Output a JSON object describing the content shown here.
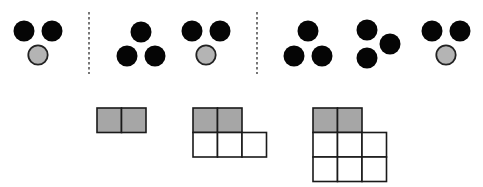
{
  "colors": {
    "background": "#ffffff",
    "black_dot": "#050505",
    "gray_dot_fill": "#b4b4b4",
    "gray_dot_stroke": "#222222",
    "gray_cell_fill": "#a6a6a6",
    "white_cell_fill": "#ffffff",
    "grid_stroke": "#1a1a1a",
    "divider": "#555555"
  },
  "dot_radius": 10.5,
  "dot_groups": [
    {
      "id": "group-1",
      "dots": [
        {
          "cx": 24,
          "cy": 31,
          "kind": "black"
        },
        {
          "cx": 52,
          "cy": 31,
          "kind": "black"
        },
        {
          "cx": 38,
          "cy": 55,
          "kind": "gray"
        }
      ]
    },
    {
      "id": "group-2",
      "dots": [
        {
          "cx": 141,
          "cy": 32,
          "kind": "black"
        },
        {
          "cx": 127,
          "cy": 56,
          "kind": "black"
        },
        {
          "cx": 155,
          "cy": 56,
          "kind": "black"
        }
      ]
    },
    {
      "id": "group-3",
      "dots": [
        {
          "cx": 192,
          "cy": 31,
          "kind": "black"
        },
        {
          "cx": 220,
          "cy": 31,
          "kind": "black"
        },
        {
          "cx": 206,
          "cy": 55,
          "kind": "gray"
        }
      ]
    },
    {
      "id": "group-4",
      "dots": [
        {
          "cx": 308,
          "cy": 31,
          "kind": "black"
        },
        {
          "cx": 294,
          "cy": 56,
          "kind": "black"
        },
        {
          "cx": 322,
          "cy": 56,
          "kind": "black"
        }
      ]
    },
    {
      "id": "group-5",
      "dots": [
        {
          "cx": 367,
          "cy": 30,
          "kind": "black"
        },
        {
          "cx": 390,
          "cy": 44,
          "kind": "black"
        },
        {
          "cx": 367,
          "cy": 58,
          "kind": "black"
        }
      ]
    },
    {
      "id": "group-6",
      "dots": [
        {
          "cx": 432,
          "cy": 31,
          "kind": "black"
        },
        {
          "cx": 460,
          "cy": 31,
          "kind": "black"
        },
        {
          "cx": 446,
          "cy": 55,
          "kind": "gray"
        }
      ]
    }
  ],
  "dividers": [
    {
      "x": 89,
      "y1": 12,
      "y2": 74
    },
    {
      "x": 257,
      "y1": 12,
      "y2": 74
    }
  ],
  "cell_size": 24.5,
  "grids": [
    {
      "id": "grid-1",
      "x": 97,
      "y": 108,
      "rows": [
        [
          "gray",
          "gray"
        ]
      ]
    },
    {
      "id": "grid-2",
      "x": 193,
      "y": 108,
      "rows": [
        [
          "gray",
          "gray"
        ],
        [
          "white",
          "white",
          "white"
        ]
      ]
    },
    {
      "id": "grid-3",
      "x": 313,
      "y": 108,
      "rows": [
        [
          "gray",
          "gray"
        ],
        [
          "white",
          "white",
          "white"
        ],
        [
          "white",
          "white",
          "white"
        ]
      ]
    }
  ]
}
